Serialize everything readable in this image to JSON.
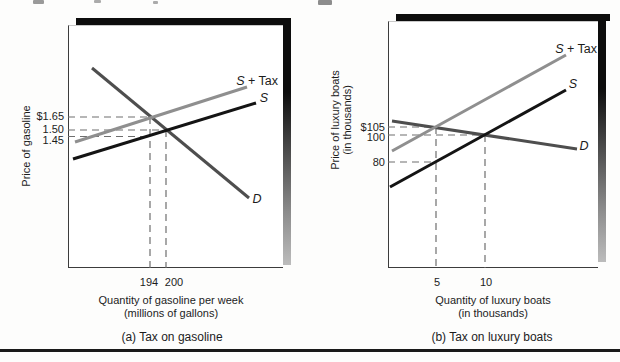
{
  "figure": {
    "panels": [
      {
        "caption": "(a) Tax on gasoline",
        "y_axis_label_lines": [
          "Price of gasoline"
        ],
        "x_axis_label_lines": [
          "Quantity of gasoline per week",
          "(millions of gallons)"
        ],
        "price_labels": [
          "$1.65",
          "1.50",
          "1.45"
        ],
        "quantity_labels": [
          "194",
          "200"
        ],
        "curve_labels": {
          "s": "S",
          "plus_tax": " + Tax",
          "d": "D"
        }
      },
      {
        "caption": "(b) Tax on luxury boats",
        "y_axis_label_lines": [
          "Price of luxury boats",
          "(in thousands)"
        ],
        "x_axis_label_lines": [
          "Quantity of luxury boats",
          "(in thousands)"
        ],
        "price_labels": [
          "$105",
          "100",
          "80"
        ],
        "quantity_labels": [
          "5",
          "10"
        ],
        "curve_labels": {
          "s": "S",
          "plus_tax": " + Tax",
          "d": "D"
        }
      }
    ]
  },
  "chart_data": [
    {
      "type": "line",
      "title": "(a) Tax on gasoline",
      "xlabel": "Quantity of gasoline per week (millions of gallons)",
      "ylabel": "Price of gasoline",
      "grid": false,
      "legend_position": "labels-at-curve-ends",
      "xticks": [
        194,
        200
      ],
      "yticks": [
        "$1.65",
        "1.50",
        "1.45"
      ],
      "series": [
        {
          "name": "D",
          "role": "demand",
          "points": [
            [
              194,
              1.65
            ],
            [
              200,
              1.5
            ]
          ]
        },
        {
          "name": "S",
          "role": "supply",
          "points": [
            [
              194,
              1.45
            ],
            [
              200,
              1.5
            ]
          ]
        },
        {
          "name": "S + Tax",
          "role": "supply-plus-tax",
          "points": [
            [
              194,
              1.65
            ],
            [
              200,
              1.7
            ]
          ]
        }
      ],
      "annotations": {
        "equilibrium_before_tax": {
          "quantity": 200,
          "price": 1.5
        },
        "equilibrium_after_tax": {
          "quantity": 194,
          "price_paid_by_buyers": 1.65,
          "price_received_by_sellers": 1.45
        },
        "tax_per_unit": 0.2
      }
    },
    {
      "type": "line",
      "title": "(b) Tax on luxury boats",
      "xlabel": "Quantity of luxury boats (in thousands)",
      "ylabel": "Price of luxury boats (in thousands)",
      "grid": false,
      "legend_position": "labels-at-curve-ends",
      "xticks": [
        5,
        10
      ],
      "yticks": [
        "$105",
        "100",
        "80"
      ],
      "series": [
        {
          "name": "D",
          "role": "demand",
          "points": [
            [
              5,
              105
            ],
            [
              10,
              100
            ]
          ]
        },
        {
          "name": "S",
          "role": "supply",
          "points": [
            [
              5,
              80
            ],
            [
              10,
              100
            ]
          ]
        },
        {
          "name": "S + Tax",
          "role": "supply-plus-tax",
          "points": [
            [
              5,
              105
            ],
            [
              10,
              125
            ]
          ]
        }
      ],
      "annotations": {
        "equilibrium_before_tax": {
          "quantity": 10,
          "price": 100
        },
        "equilibrium_after_tax": {
          "quantity": 5,
          "price_paid_by_buyers": 105,
          "price_received_by_sellers": 80
        },
        "tax_per_unit": 25
      }
    }
  ],
  "render": {
    "colors": {
      "supply": "#141414",
      "supply_tax": "#8f8f8f",
      "demand": "#4e4e4e",
      "guide": "#6e6e6e"
    },
    "guide_width": 1.2,
    "guide_dash": "7 5",
    "lines": [
      {
        "name": "panel-a-demand-curve",
        "stroke": "demand",
        "w": 3,
        "x1": 92,
        "y1": 68,
        "x2": 249,
        "y2": 198
      },
      {
        "name": "panel-a-supply-curve",
        "stroke": "supply",
        "w": 3,
        "x1": 73,
        "y1": 159,
        "x2": 256,
        "y2": 103
      },
      {
        "name": "panel-a-supply-tax-curve",
        "stroke": "supply_tax",
        "w": 3,
        "x1": 75,
        "y1": 142,
        "x2": 247,
        "y2": 87
      },
      {
        "name": "panel-b-demand-curve",
        "stroke": "demand",
        "w": 3,
        "x1": 392,
        "y1": 121,
        "x2": 577,
        "y2": 149
      },
      {
        "name": "panel-b-supply-curve",
        "stroke": "supply",
        "w": 3,
        "x1": 390,
        "y1": 187,
        "x2": 566,
        "y2": 90
      },
      {
        "name": "panel-b-supply-tax-curve",
        "stroke": "supply_tax",
        "w": 3,
        "x1": 392,
        "y1": 151,
        "x2": 566,
        "y2": 55
      }
    ],
    "guides": [
      {
        "name": "panel-a-guide-price-165",
        "x1": 68,
        "y1": 117,
        "x2": 150,
        "y2": 117
      },
      {
        "name": "panel-a-guide-price-150",
        "x1": 68,
        "y1": 130,
        "x2": 166,
        "y2": 130
      },
      {
        "name": "panel-a-guide-price-145",
        "x1": 68,
        "y1": 136.5,
        "x2": 150,
        "y2": 136.5
      },
      {
        "name": "panel-a-guide-qty-194",
        "x1": 150,
        "y1": 117,
        "x2": 150,
        "y2": 268
      },
      {
        "name": "panel-a-guide-qty-200",
        "x1": 166,
        "y1": 130,
        "x2": 166,
        "y2": 268
      },
      {
        "name": "panel-b-guide-price-105",
        "x1": 388,
        "y1": 127,
        "x2": 436,
        "y2": 127
      },
      {
        "name": "panel-b-guide-price-100",
        "x1": 388,
        "y1": 135,
        "x2": 485,
        "y2": 135
      },
      {
        "name": "panel-b-guide-price-80",
        "x1": 388,
        "y1": 162,
        "x2": 436,
        "y2": 162
      },
      {
        "name": "panel-b-guide-qty-5",
        "x1": 436,
        "y1": 127,
        "x2": 436,
        "y2": 268
      },
      {
        "name": "panel-b-guide-qty-10",
        "x1": 485,
        "y1": 135,
        "x2": 485,
        "y2": 268
      }
    ]
  }
}
